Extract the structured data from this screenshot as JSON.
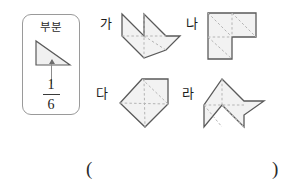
{
  "reference": {
    "label": "부분",
    "fraction": {
      "numerator": "1",
      "denominator": "6"
    },
    "shape_name": "right-triangle",
    "arrow_name": "down-arrow"
  },
  "figures": [
    {
      "id": "ga",
      "label": "가",
      "shape": "double-peak-arrow-polygon",
      "parts": 6
    },
    {
      "id": "na",
      "label": "나",
      "shape": "L-shape-polygon",
      "parts": 6
    },
    {
      "id": "da",
      "label": "다",
      "shape": "pentagon-house-polygon",
      "parts": 6
    },
    {
      "id": "ra",
      "label": "라",
      "shape": "pinwheel-arrow-polygon",
      "parts": 6
    }
  ],
  "answer": {
    "open_paren": "(",
    "close_paren": ")",
    "value": ""
  },
  "colors": {
    "outline": "#5a5a5a",
    "fill": "#f2f2f2",
    "dashed": "#b4b4b4",
    "text": "#1c1c1c",
    "box_border": "#9a9a9a"
  }
}
